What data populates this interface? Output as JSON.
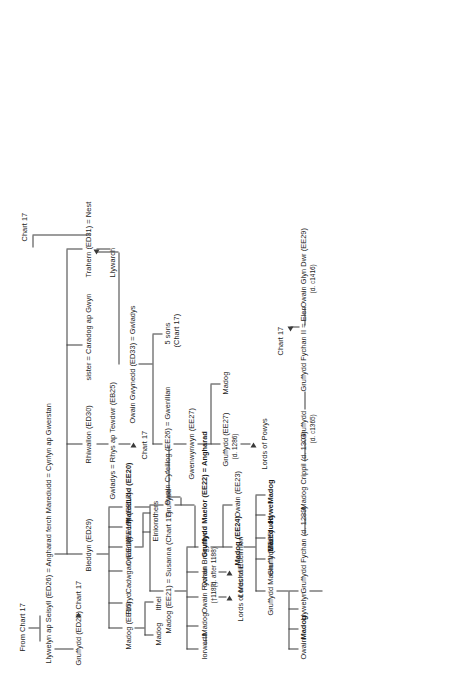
{
  "chart": {
    "source_note": "From Chart 17",
    "cross_refs": [
      "Chart 17"
    ],
    "line_color": "#3a3a3a",
    "text_color": "#1c1c1c",
    "background": "#ffffff"
  },
  "nodes": {
    "from_chart": "From Chart 17",
    "root_marriage": "Llywelyn ap Seisyll (ED26) = Angharad ferch Maredudd = Cynfyn ap Gwerstan",
    "gruffydd_ed28": "Gruffydd (ED28)",
    "gruffydd_ed28_ref": "Chart 17",
    "bleddyn": "Bleddyn (ED29)",
    "rhiwallon": "Rhiwallon (ED30)",
    "sister_caradog": "sister = Caradog ap Gwyn",
    "trahern": "Trahern (ED31) = Nest",
    "trahern_ref": "Chart 17",
    "llywarch": "Llywarch",
    "gwladys_rhys": "Gwladys = Rhys ap Tewdwr (EB25)",
    "gwladys_rhys_ref": "Chart 17",
    "owain_gwynedd": "Owain Gwynedd (ED33) = Gwladys",
    "five_sons": "5 sons",
    "five_sons_ref": "(Chart 17)",
    "madog_ee16": "Madog (EE16)",
    "rhiryd": "Rhiryd",
    "cadwgan_ee18": "Cadwgan (EE18)",
    "owain_ee19": "Owain (EE19)",
    "iorwerth_ee17": "Iorwerth (EE17)",
    "einion": "Einion",
    "others": "others",
    "maredudd_ee20": "Maredudd (EE20)",
    "madog_son_of_madog": "Madog",
    "ithel": "Ithel",
    "iorwerth_b": "Iorwerth",
    "madog_c": "Madog",
    "madog_ee21": "Madog (EE21) = Susanna (Chart 17)",
    "gruffydd_mid": "Gruffydd",
    "owain_cyfeiliog": "Owain Cyfeiliog (EE26) = Gwenllian",
    "gwenwynwyn": "Gwenwynwyn (EE27)",
    "gruffydd_ee27": "Gruffydd (EE27)",
    "gruffydd_ee27_died": "(d. 1286)",
    "madog_powys": "Madog",
    "lords_of_powys": "Lords of Powys",
    "owain_fychan": "Owain Fychan",
    "owain_fychan_died": "(†1187)",
    "lords_of_mechain": "Lords of Mechain",
    "owain_brogyntyn": "Owain Brogyntyn",
    "owain_brogyntyn_died": "(d. after 1188)",
    "lords_of_edeirnion": "Lords of Edeirnion",
    "gruffydd_maelor": "Gruffydd Maelor (EE22) = Angharad",
    "owain_ee23": "Owain (EE23)",
    "madog_ee24": "Madog (EE24)",
    "gruffydd_ial": "Gruffydd Ial",
    "maredudd_b": "Maredudd",
    "hywel": "Hywel",
    "madog_d": "Madog",
    "gruffydd_maelor_ii": "Gruffydd Maelor II (EE25)",
    "owain_e": "Owain",
    "madog_e": "Madog",
    "llywelyn": "Llywelyn",
    "gruffydd_fychan": "Gruffydd Fychan (d. 1289)",
    "madog_crippil": "Madog Crippil (d. 1304)",
    "gruffydd_c1365": "Gruffydd",
    "gruffydd_c1365_died": "(d. c1365)",
    "gruffydd_fychan_ii": "Gruffydd Fychan II = Elen",
    "gruffydd_fychan_ii_ref": "Chart 17",
    "owain_glyn_dwr": "Owain Glyn Dwr (EE29)",
    "owain_glyn_dwr_died": "(d. c1416)"
  }
}
